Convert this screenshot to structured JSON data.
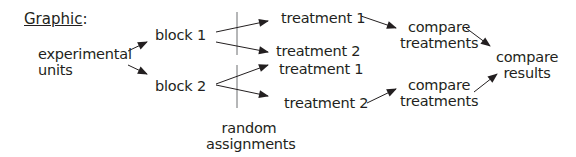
{
  "title": {
    "label": "Graphic",
    "suffix": ":"
  },
  "nodes": {
    "units": "experimental\nunits",
    "units_line1": "experimental",
    "units_line2": "units",
    "block1": "block 1",
    "block2": "block 2",
    "b1_t1": "treatment 1",
    "b1_t2": "treatment 2",
    "b2_t1": "treatment 1",
    "b2_t2": "treatment 2",
    "compare1_line1": "compare",
    "compare1_line2": "treatments",
    "compare2_line1": "compare",
    "compare2_line2": "treatments",
    "results_line1": "compare",
    "results_line2": "results",
    "random_line1": "random",
    "random_line2": "assignments"
  },
  "colors": {
    "ink": "#231f20",
    "rule": "#6d6e71"
  }
}
